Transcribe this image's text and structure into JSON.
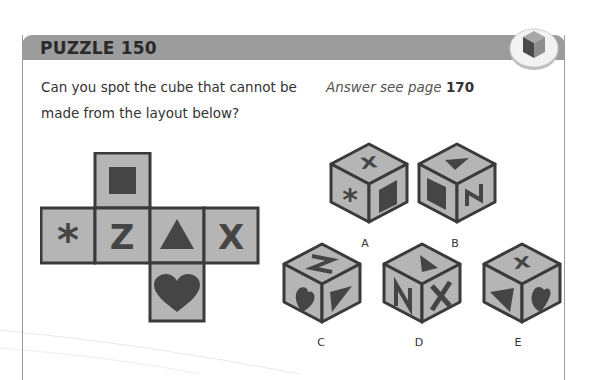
{
  "puzzle": {
    "title": "PUZZLE 150",
    "question": "Can you spot the cube that cannot be made from the layout below?",
    "answer_prefix": "Answer see page",
    "answer_page": "170"
  },
  "badge_icon": "cube-icon",
  "colors": {
    "header": "#9c9c9c",
    "face": "#b5b5b5",
    "symbol": "#4a4a4a",
    "outline": "#3a3a3a"
  },
  "net": {
    "faces": [
      {
        "position": "top",
        "symbol": "square"
      },
      {
        "position": "left",
        "symbol": "asterisk"
      },
      {
        "position": "center-left",
        "symbol": "Z"
      },
      {
        "position": "center-right",
        "symbol": "triangle"
      },
      {
        "position": "right",
        "symbol": "X"
      },
      {
        "position": "bottom",
        "symbol": "heart"
      }
    ]
  },
  "cubes": [
    {
      "label": "A",
      "top": "X",
      "left": "asterisk",
      "right": "square"
    },
    {
      "label": "B",
      "top": "triangle",
      "left": "square",
      "right": "Z (rotated)"
    },
    {
      "label": "C",
      "top": "Z (rotated)",
      "left": "heart",
      "right": "triangle"
    },
    {
      "label": "D",
      "top": "triangle",
      "left": "Z (rotated)",
      "right": "X"
    },
    {
      "label": "E",
      "top": "X",
      "left": "triangle",
      "right": "heart"
    }
  ]
}
